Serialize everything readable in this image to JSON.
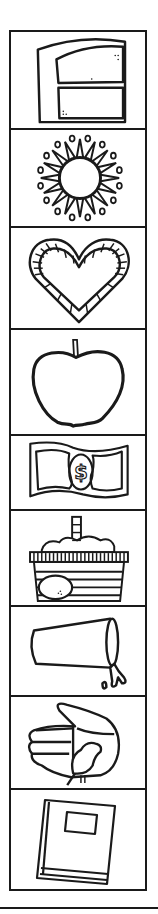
{
  "worksheet": {
    "title": "Picture strip",
    "colors": {
      "ink": "#1a1a1a",
      "paper": "#ffffff"
    },
    "items": [
      {
        "label": "door",
        "icon": "door-icon"
      },
      {
        "label": "sun",
        "icon": "sun-icon"
      },
      {
        "label": "heart",
        "icon": "heart-icon"
      },
      {
        "label": "apple",
        "icon": "apple-icon"
      },
      {
        "label": "money",
        "icon": "dollar-bill-icon"
      },
      {
        "label": "basket",
        "icon": "basket-icon"
      },
      {
        "label": "cup",
        "icon": "spilled-cup-icon"
      },
      {
        "label": "hand",
        "icon": "hand-with-bird-icon"
      },
      {
        "label": "book",
        "icon": "book-icon"
      }
    ]
  }
}
